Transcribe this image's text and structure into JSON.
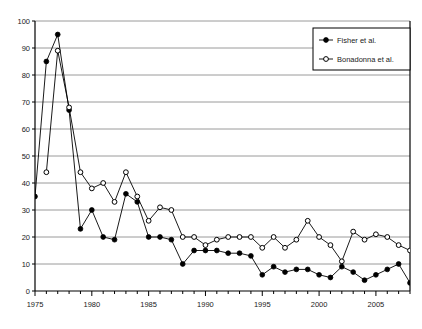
{
  "chart_data": {
    "type": "line",
    "title": "",
    "xlabel": "",
    "ylabel": "",
    "xlim": [
      1975,
      2008
    ],
    "ylim": [
      0,
      100
    ],
    "ytick_step": 10,
    "yticks": [
      0,
      10,
      20,
      30,
      40,
      50,
      60,
      70,
      80,
      90,
      100
    ],
    "xticks_labeled": [
      1975,
      1980,
      1985,
      1990,
      1995,
      2000,
      2005
    ],
    "xtick_step_minor": 1,
    "grid": "horizontal",
    "legend_position": "top-right",
    "series": [
      {
        "name": "Fisher et al.",
        "marker": "filled-circle",
        "color": "#000000",
        "x": [
          1975,
          1976,
          1977,
          1978,
          1979,
          1980,
          1981,
          1982,
          1983,
          1984,
          1985,
          1986,
          1987,
          1988,
          1989,
          1990,
          1991,
          1992,
          1993,
          1994,
          1995,
          1996,
          1997,
          1998,
          1999,
          2000,
          2001,
          2002,
          2003,
          2004,
          2005,
          2006,
          2007,
          2008
        ],
        "values": [
          35,
          85,
          95,
          67,
          23,
          30,
          20,
          19,
          36,
          33,
          20,
          20,
          19,
          10,
          15,
          15,
          15,
          14,
          14,
          13,
          6,
          9,
          7,
          8,
          8,
          6,
          5,
          9,
          7,
          4,
          6,
          8,
          10,
          3
        ],
        "y_raw": [
          35,
          85,
          95,
          67,
          23,
          30,
          20,
          19,
          36,
          33,
          20,
          20,
          19,
          10,
          15,
          15,
          15,
          14,
          14,
          13,
          6,
          9,
          7,
          8,
          8,
          6,
          5,
          9,
          7,
          4,
          6,
          8,
          10,
          3
        ]
      },
      {
        "name": "Bonadonna et al.",
        "marker": "open-circle",
        "color": "#000000",
        "x": [
          1976,
          1977,
          1978,
          1979,
          1980,
          1981,
          1982,
          1983,
          1984,
          1985,
          1986,
          1987,
          1988,
          1989,
          1990,
          1991,
          1992,
          1993,
          1994,
          1995,
          1996,
          1997,
          1998,
          1999,
          2000,
          2001,
          2002,
          2003,
          2004,
          2005,
          2006,
          2007,
          2008
        ],
        "values": [
          44,
          89,
          68,
          44,
          38,
          40,
          33,
          44,
          35,
          26,
          31,
          30,
          20,
          20,
          17,
          19,
          20,
          20,
          20,
          16,
          20,
          16,
          19,
          26,
          20,
          17,
          11,
          22,
          19,
          21,
          20,
          17,
          15
        ],
        "y_raw": [
          44,
          89,
          68,
          44,
          38,
          40,
          33,
          44,
          35,
          26,
          31,
          30,
          20,
          20,
          17,
          19,
          20,
          20,
          20,
          16,
          20,
          16,
          19,
          26,
          20,
          17,
          11,
          22,
          19,
          21,
          20,
          17,
          15
        ]
      }
    ]
  },
  "legend": {
    "entries": [
      {
        "label": "Fisher et al.",
        "marker": "filled-circle"
      },
      {
        "label": "Bonadonna et al.",
        "marker": "open-circle"
      }
    ]
  },
  "axis": {
    "y_labels": [
      "0",
      "10",
      "20",
      "30",
      "40",
      "50",
      "60",
      "70",
      "80",
      "90",
      "100"
    ],
    "x_labels": [
      "1975",
      "1980",
      "1985",
      "1990",
      "1995",
      "2000",
      "2005"
    ]
  },
  "colors": {
    "axis": "#000000",
    "grid": "#808080",
    "series": "#000000",
    "background": "#ffffff"
  }
}
